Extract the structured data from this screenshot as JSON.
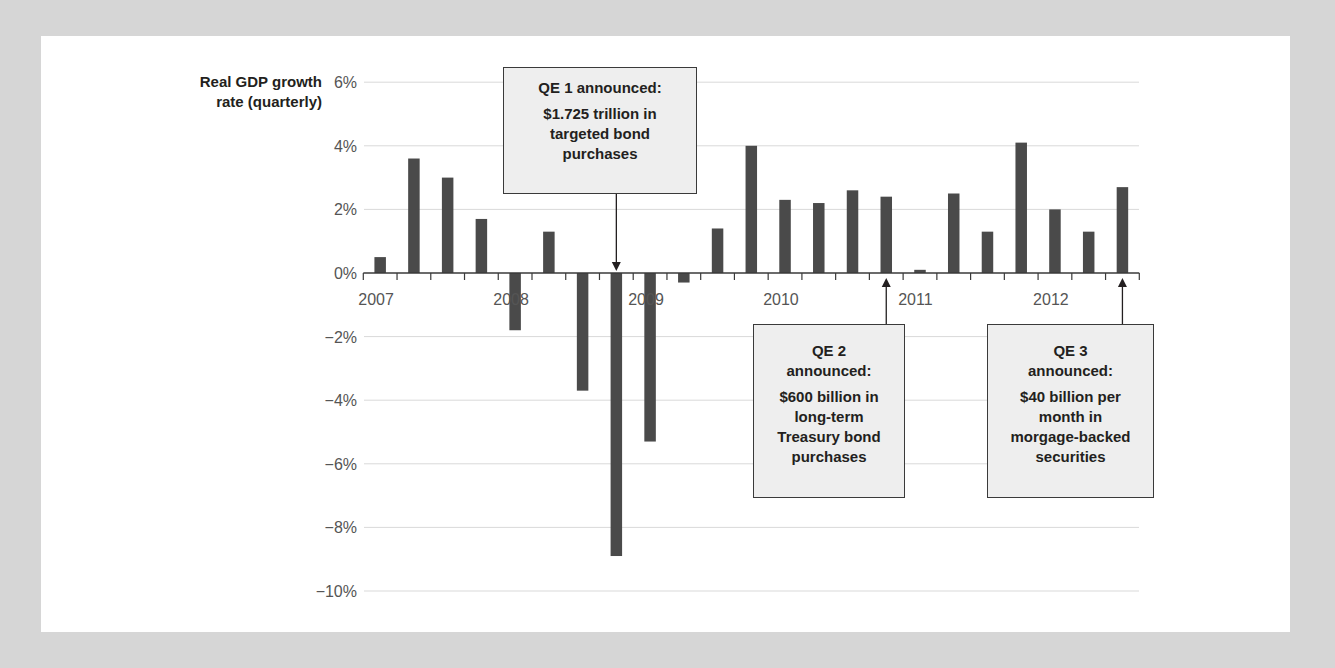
{
  "chart_data": {
    "type": "bar",
    "title": "",
    "ylabel": "Real GDP growth rate (quarterly)",
    "xlabel": "",
    "ylim": [
      -10,
      6
    ],
    "yticks": [
      6,
      4,
      2,
      0,
      -2,
      -4,
      -6,
      -8,
      -10
    ],
    "ytick_labels": [
      "6%",
      "4%",
      "2%",
      "0%",
      "−2%",
      "−4%",
      "−6%",
      "−8%",
      "−10%"
    ],
    "xtick_labels": [
      "2007",
      "2008",
      "2009",
      "2010",
      "2011",
      "2012"
    ],
    "grid": true,
    "categories": [
      "2007Q1",
      "2007Q2",
      "2007Q3",
      "2007Q4",
      "2008Q1",
      "2008Q2",
      "2008Q3",
      "2008Q4",
      "2009Q1",
      "2009Q2",
      "2009Q3",
      "2009Q4",
      "2010Q1",
      "2010Q2",
      "2010Q3",
      "2010Q4",
      "2011Q1",
      "2011Q2",
      "2011Q3",
      "2011Q4",
      "2012Q1",
      "2012Q2",
      "2012Q3"
    ],
    "values": [
      0.5,
      3.6,
      3.0,
      1.7,
      -1.8,
      1.3,
      -3.7,
      -8.9,
      -5.3,
      -0.3,
      1.4,
      4.0,
      2.3,
      2.2,
      2.6,
      2.4,
      0.1,
      2.5,
      1.3,
      4.1,
      2.0,
      1.3,
      2.7
    ],
    "annotations": [
      {
        "target": "2008Q4",
        "label": "QE 1 announced:",
        "text": "$1.725 trillion in targeted bond purchases"
      },
      {
        "target": "2010Q4",
        "label": "QE 2 announced:",
        "text": "$600 billion in long-term Treasury bond purchases"
      },
      {
        "target": "2012Q3",
        "label": "QE 3 announced:",
        "text": "$40 billion per month in morgage-backed securities"
      }
    ]
  },
  "axis_title": {
    "line1": "Real GDP growth",
    "line2": "rate (quarterly)"
  },
  "callouts": {
    "qe1": {
      "head": "QE 1 announced:",
      "lines": [
        "$1.725 trillion in",
        "targeted bond",
        "purchases"
      ]
    },
    "qe2": {
      "head1": "QE 2",
      "head2": "announced:",
      "lines": [
        "$600 billion in",
        "long-term",
        "Treasury bond",
        "purchases"
      ]
    },
    "qe3": {
      "head1": "QE 3",
      "head2": "announced:",
      "lines": [
        "$40 billion per",
        "month in",
        "morgage-backed",
        "securities"
      ]
    }
  },
  "colors": {
    "bar": "#4a4a4a",
    "grid": "#d9d9d9",
    "axis": "#3a3a3a",
    "tick_label": "#555555",
    "background": "#d6d6d6",
    "panel": "#ffffff",
    "callout_fill": "#eeeeee"
  }
}
